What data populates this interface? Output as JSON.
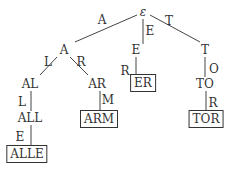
{
  "trie": {
    "root": {
      "label": "ε",
      "x": 143,
      "y": 12
    },
    "nodes": [
      {
        "id": "A",
        "label": "A",
        "x": 64,
        "y": 50,
        "terminal": false
      },
      {
        "id": "E",
        "label": "E",
        "x": 136,
        "y": 50,
        "terminal": false
      },
      {
        "id": "T",
        "label": "T",
        "x": 205,
        "y": 50,
        "terminal": false
      },
      {
        "id": "AL",
        "label": "AL",
        "x": 30,
        "y": 84,
        "terminal": false
      },
      {
        "id": "AR",
        "label": "AR",
        "x": 97,
        "y": 84,
        "terminal": false
      },
      {
        "id": "ER",
        "label": "ER",
        "x": 143,
        "y": 83,
        "terminal": true
      },
      {
        "id": "TO",
        "label": "TO",
        "x": 205,
        "y": 84,
        "terminal": false
      },
      {
        "id": "ALL",
        "label": "ALL",
        "x": 30,
        "y": 118,
        "terminal": false
      },
      {
        "id": "ARM",
        "label": "ARM",
        "x": 99,
        "y": 119,
        "terminal": true
      },
      {
        "id": "TOR",
        "label": "TOR",
        "x": 206,
        "y": 119,
        "terminal": true
      },
      {
        "id": "ALLE",
        "label": "ALLE",
        "x": 27,
        "y": 154,
        "terminal": true
      }
    ],
    "edge_labels": [
      {
        "label": "A",
        "x": 102,
        "y": 20
      },
      {
        "label": "E",
        "x": 150,
        "y": 31
      },
      {
        "label": "T",
        "x": 169,
        "y": 21
      },
      {
        "label": "L",
        "x": 48,
        "y": 62
      },
      {
        "label": "R",
        "x": 81,
        "y": 62
      },
      {
        "label": "R",
        "x": 125,
        "y": 71
      },
      {
        "label": "O",
        "x": 214,
        "y": 69
      },
      {
        "label": "L",
        "x": 22,
        "y": 102
      },
      {
        "label": "M",
        "x": 108,
        "y": 100
      },
      {
        "label": "R",
        "x": 213,
        "y": 103
      },
      {
        "label": "E",
        "x": 20,
        "y": 137
      }
    ]
  }
}
